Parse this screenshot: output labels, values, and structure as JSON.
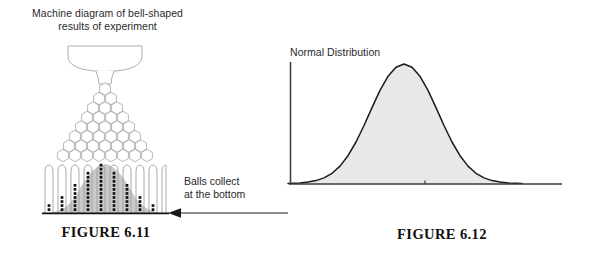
{
  "figure_6_11": {
    "title_line_1": "Machine diagram of bell-shaped",
    "title_line_2": "results of experiment",
    "caption": "FIGURE 6.11",
    "machine": {
      "hopper_label": "hopper-funnel",
      "peg_rows": 8,
      "bin_count": 9,
      "bin_ball_counts": [
        2,
        4,
        7,
        10,
        12,
        10,
        7,
        4,
        2
      ],
      "ball_color": "#111111",
      "bell_shade_color": "#c9c9c9",
      "outline_color": "#9a9a9a",
      "baseline_color": "#111111"
    }
  },
  "annotation": {
    "line_1": "Balls collect",
    "line_2": "at the bottom",
    "arrow_direction": "left",
    "arrow_color": "#1a1a1a"
  },
  "figure_6_12": {
    "title": "Normal Distribution",
    "caption": "FIGURE 6.12",
    "axis_color": "#3a3a3a",
    "curve_color": "#1a1a1a",
    "fill_color": "#e8e8e8",
    "center_tick_label": ""
  },
  "chart_data": {
    "type": "area",
    "title": "Normal Distribution",
    "xlabel": "",
    "ylabel": "",
    "grid": false,
    "legend": null,
    "axis_ranges": {
      "x": [
        -4,
        4
      ],
      "y": [
        0,
        0.45
      ]
    },
    "tick_labels": {
      "x": [
        ""
      ],
      "y": []
    },
    "annotations": [
      "center tick at mean"
    ],
    "series": [
      {
        "name": "Normal Distribution",
        "x": [
          -4.0,
          -3.6,
          -3.2,
          -2.8,
          -2.4,
          -2.0,
          -1.6,
          -1.2,
          -0.8,
          -0.4,
          0.0,
          0.4,
          0.8,
          1.2,
          1.6,
          2.0,
          2.4,
          2.8,
          3.2,
          3.6,
          4.0
        ],
        "y": [
          0.0001,
          0.0006,
          0.0024,
          0.0079,
          0.0224,
          0.054,
          0.1109,
          0.1942,
          0.2897,
          0.3683,
          0.3989,
          0.3683,
          0.2897,
          0.1942,
          0.1109,
          0.054,
          0.0224,
          0.0079,
          0.0024,
          0.0006,
          0.0001
        ]
      }
    ]
  },
  "histogram_data": {
    "type": "bar",
    "title": "Balls collected in bins",
    "categories": [
      "1",
      "2",
      "3",
      "4",
      "5",
      "6",
      "7",
      "8",
      "9"
    ],
    "values": [
      2,
      4,
      7,
      10,
      12,
      10,
      7,
      4,
      2
    ],
    "xlabel": "",
    "ylabel": "number of balls",
    "ylim": [
      0,
      13
    ]
  }
}
